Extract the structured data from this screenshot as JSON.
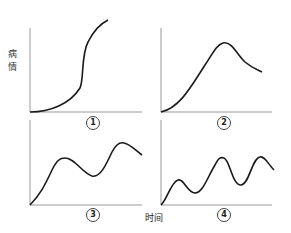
{
  "y_label": "病情",
  "y_label_chars": [
    "病",
    "情"
  ],
  "x_label": "时间",
  "panels": [
    {
      "label": "1",
      "description": "S-shaped curve: slow rise, then steep rise, then leveling at high value"
    },
    {
      "label": "2",
      "description": "Rise to single peak then decline"
    },
    {
      "label": "3",
      "description": "Rise to peak, dip, then higher second peak and slight decline"
    },
    {
      "label": "4",
      "description": "Multiple oscillating peaks with increasing amplitude"
    }
  ],
  "colors": {
    "curve": "#1a1a1a",
    "axis": "#999999",
    "background": "#ffffff"
  }
}
